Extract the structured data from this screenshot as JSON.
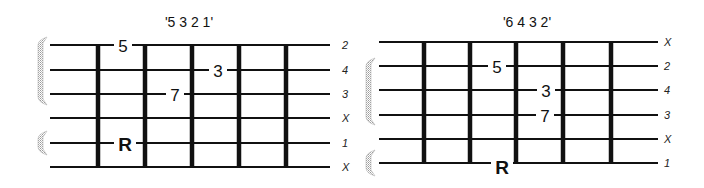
{
  "diagrams": [
    {
      "id": "left",
      "title": "'5  3  2  1'",
      "title_pos": {
        "x": 189,
        "y": 27
      },
      "string_y": [
        45,
        70,
        94,
        118,
        143,
        167
      ],
      "string_x": [
        50,
        330
      ],
      "frets_x": [
        98,
        145,
        192,
        239,
        286
      ],
      "fret_y": [
        45,
        167
      ],
      "finger_labels": [
        "2",
        "4",
        "3",
        "X",
        "1",
        "X"
      ],
      "finger_x": 342,
      "notes": [
        {
          "label": "5",
          "x": 123,
          "y": 45,
          "root": false
        },
        {
          "label": "3",
          "x": 218,
          "y": 70,
          "root": false
        },
        {
          "label": "7",
          "x": 175,
          "y": 94,
          "root": false
        },
        {
          "label": "R",
          "x": 125,
          "y": 143,
          "root": true
        }
      ],
      "brackets": [
        {
          "y1": 37,
          "y2": 105
        },
        {
          "y1": 131,
          "y2": 155
        }
      ],
      "bracket_x": 38
    },
    {
      "id": "right",
      "title": "'6  4  3  2'",
      "title_pos": {
        "x": 527,
        "y": 27
      },
      "string_y": [
        42,
        66,
        90,
        115,
        139,
        163
      ],
      "string_x": [
        379,
        658
      ],
      "frets_x": [
        424,
        470,
        516,
        563,
        611
      ],
      "fret_y": [
        42,
        163
      ],
      "finger_labels": [
        "X",
        "2",
        "4",
        "3",
        "X",
        "1"
      ],
      "finger_x": 664,
      "notes": [
        {
          "label": "5",
          "x": 497,
          "y": 66,
          "root": false
        },
        {
          "label": "3",
          "x": 546,
          "y": 90,
          "root": false
        },
        {
          "label": "7",
          "x": 545,
          "y": 115,
          "root": false
        },
        {
          "label": "R",
          "x": 502,
          "y": 166,
          "root": true
        }
      ],
      "brackets": [
        {
          "y1": 58,
          "y2": 125
        },
        {
          "y1": 150,
          "y2": 176
        }
      ],
      "bracket_x": 366
    }
  ],
  "colors": {
    "line": "#111111",
    "bracket": "#b8b8b8",
    "background": "#ffffff"
  }
}
